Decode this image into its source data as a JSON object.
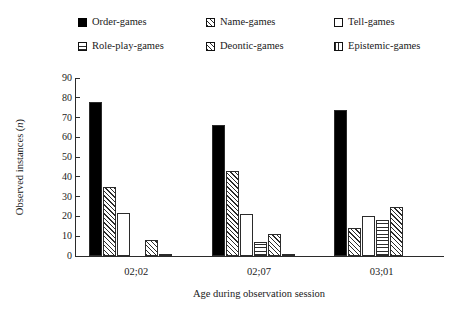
{
  "chart_data": {
    "type": "bar",
    "title": "",
    "subtitle": "",
    "xlabel": "Age during observation session",
    "ylabel": "Observed instances (n)",
    "ylabel_plain": "Observed instances (",
    "ylabel_italic": "n",
    "ylabel_close": ")",
    "categories": [
      "02;02",
      "02;07",
      "03;01"
    ],
    "ylim": [
      0,
      90
    ],
    "yticks": [
      0,
      10,
      20,
      30,
      40,
      50,
      60,
      70,
      80,
      90
    ],
    "ytick_labels": [
      "0",
      "10",
      "20",
      "30",
      "40",
      "50",
      "60",
      "70",
      "80",
      "90"
    ],
    "grid": false,
    "legend_position": "top",
    "legend_columns": 3,
    "series": [
      {
        "name": "Order-games",
        "pattern": "solid-black",
        "swatch_class": "pat-solid",
        "values": [
          78,
          66,
          74
        ]
      },
      {
        "name": "Name-games",
        "pattern": "diagonal-hatch",
        "swatch_class": "pat-diagonal",
        "values": [
          35,
          43,
          14
        ]
      },
      {
        "name": "Tell-games",
        "pattern": "empty-white",
        "swatch_class": "pat-empty",
        "values": [
          22,
          21,
          20
        ]
      },
      {
        "name": "Role-play-games",
        "pattern": "horizontal-lines",
        "swatch_class": "pat-horizontal",
        "values": [
          0,
          7,
          18
        ]
      },
      {
        "name": "Deontic-games",
        "pattern": "cross-hatch",
        "swatch_class": "pat-crosshatch",
        "values": [
          8,
          11,
          25
        ]
      },
      {
        "name": "Epistemic-games",
        "pattern": "vertical-lines",
        "swatch_class": "pat-vertical",
        "values": [
          1,
          1,
          0
        ]
      }
    ]
  },
  "legend": {
    "items": [
      {
        "label": "Order-games",
        "swatch": "pat-solid",
        "swatch_name": "legend-swatch-order-games"
      },
      {
        "label": "Name-games",
        "swatch": "pat-diagonal",
        "swatch_name": "legend-swatch-name-games"
      },
      {
        "label": "Tell-games",
        "swatch": "pat-empty",
        "swatch_name": "legend-swatch-tell-games"
      },
      {
        "label": "Role-play-games",
        "swatch": "pat-horizontal",
        "swatch_name": "legend-swatch-role-play-games"
      },
      {
        "label": "Deontic-games",
        "swatch": "pat-crosshatch",
        "swatch_name": "legend-swatch-deontic-games"
      },
      {
        "label": "Epistemic-games",
        "swatch": "pat-vertical",
        "swatch_name": "legend-swatch-epistemic-games"
      }
    ]
  },
  "colors": {
    "axis": "#2b2b2b",
    "bar_outline": "#2b2b2b",
    "bar_solid": "#000000",
    "background": "#ffffff",
    "text": "#1a1a1a"
  }
}
